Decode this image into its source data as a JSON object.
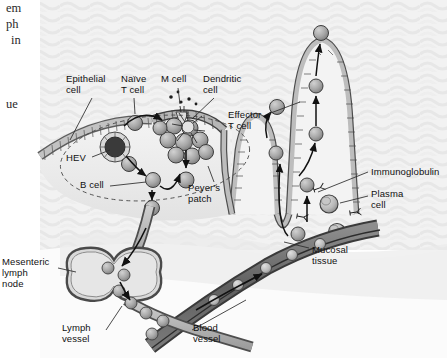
{
  "figure": {
    "background_color": "#ffffff",
    "texture_color": "#f1f1f1",
    "ink_color": "#111111",
    "cell_fill": "#a9a9a9",
    "cell_stroke": "#4a4a4a",
    "vessel_fill": "#9a9a9a",
    "blood_vessel_fill": "#6e6e6e",
    "epithelium_fill": "#b4b4b4",
    "lumen_fill": "#e8e8e8"
  },
  "page_fragments": [
    {
      "text": "em",
      "x": 6,
      "y": 4
    },
    {
      "text": "ph",
      "x": 6,
      "y": 20
    },
    {
      "text": "in",
      "x": 10,
      "y": 36
    },
    {
      "text": "ue",
      "x": 6,
      "y": 99
    }
  ],
  "labels": [
    {
      "id": "epithelial-cell",
      "text": "Epithelial\ncell",
      "x": 66,
      "y": 75
    },
    {
      "id": "naive-t-cell",
      "text": "Naïve\nT cell",
      "x": 121,
      "y": 75
    },
    {
      "id": "m-cell",
      "text": "M cell",
      "x": 161,
      "y": 75
    },
    {
      "id": "dendritic-cell",
      "text": "Dendritic\ncell",
      "x": 203,
      "y": 75
    },
    {
      "id": "effector-t-cell",
      "text": "Effector\nT cell",
      "x": 231,
      "y": 111
    },
    {
      "id": "hev",
      "text": "HEV",
      "x": 69,
      "y": 155
    },
    {
      "id": "b-cell",
      "text": "B cell",
      "x": 83,
      "y": 182
    },
    {
      "id": "peyers-patch",
      "text": "Peyer's\npatch",
      "x": 191,
      "y": 184
    },
    {
      "id": "immunoglobulin",
      "text": "Immunoglobulin",
      "x": 371,
      "y": 168
    },
    {
      "id": "plasma-cell",
      "text": "Plasma\ncell",
      "x": 371,
      "y": 190
    },
    {
      "id": "mucosal-tissue",
      "text": "Mucosal\ntissue",
      "x": 312,
      "y": 246
    },
    {
      "id": "mesenteric-lymph-node",
      "text": "Mesenteric\nlymph\nnode",
      "x": 4,
      "y": 259
    },
    {
      "id": "lymph-vessel",
      "text": "Lymph\nvessel",
      "x": 65,
      "y": 324
    },
    {
      "id": "blood-vessel",
      "text": "Blood\nvessel",
      "x": 194,
      "y": 324
    }
  ],
  "structures": {
    "peyers_patch": "dashed oval region containing lymphocyte follicle",
    "hev": "high endothelial venule shown as ringed circle with dark core",
    "villi": "two intestinal villi on the right lined with epithelial cells",
    "lymph_node": "bilobed mesenteric lymph node on lymph vessel",
    "blood_vessel": "dark band crossing lower right carrying cells"
  },
  "cell_counts": {
    "follicle_lymphocytes": 9,
    "lymph_node_cells": 3,
    "lymph_vessel_cells": 4,
    "blood_vessel_cells": 5,
    "immunoglobulin_symbols": 4,
    "plasma_cells": 2
  }
}
